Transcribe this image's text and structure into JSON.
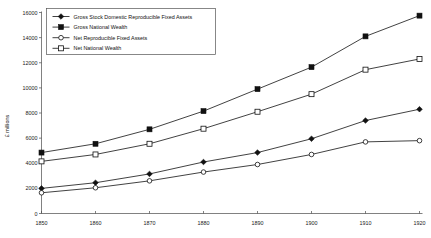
{
  "chart_data": {
    "type": "line",
    "title": "",
    "xlabel": "",
    "ylabel": "£ millions",
    "x": [
      1850,
      1860,
      1870,
      1880,
      1890,
      1900,
      1910,
      1920
    ],
    "xtick_labels": [
      "1850",
      "1860",
      "1870",
      "1880",
      "1890",
      "1900",
      "1910",
      "1920"
    ],
    "ytick_labels": [
      "0",
      "2000",
      "4000",
      "6000",
      "8000",
      "10000",
      "12000",
      "14000",
      "16000"
    ],
    "yticks": [
      0,
      2000,
      4000,
      6000,
      8000,
      10000,
      12000,
      14000,
      16000
    ],
    "ylim": [
      0,
      16000
    ],
    "xlim": [
      1850,
      1920
    ],
    "grid": false,
    "legend_position": "upper-left",
    "series": [
      {
        "name": "Gross Stock Domestic Reproducible Fixed Assets",
        "marker": "filled-diamond",
        "values": [
          2000,
          2450,
          3150,
          4100,
          4850,
          5950,
          7400,
          8300
        ]
      },
      {
        "name": "Gross National Wealth",
        "marker": "filled-square",
        "values": [
          4850,
          5550,
          6700,
          8150,
          9900,
          11650,
          14100,
          15750
        ]
      },
      {
        "name": "Net Reproducible Fixed Assets",
        "marker": "open-circle",
        "values": [
          1650,
          2050,
          2600,
          3300,
          3900,
          4700,
          5700,
          5800
        ]
      },
      {
        "name": "Net National Wealth",
        "marker": "open-square",
        "values": [
          4150,
          4700,
          5550,
          6750,
          8100,
          9500,
          11450,
          12300
        ]
      }
    ]
  }
}
